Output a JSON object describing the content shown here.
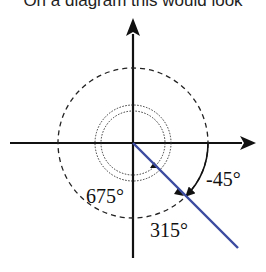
{
  "caption": "On a diagram this would look",
  "diagram": {
    "type": "coterminal-angles",
    "labels": {
      "neg45": "-45°",
      "a315": "315°",
      "a675": "675°"
    },
    "colors": {
      "axes": "#111111",
      "terminal_ray": "#3b4aa0",
      "arcs": "#222222"
    }
  }
}
